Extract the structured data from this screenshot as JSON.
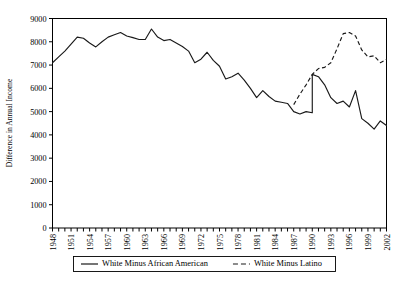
{
  "chart_data": {
    "type": "line",
    "title": "",
    "xlabel": "",
    "ylabel": "Difference in Annual Income",
    "ylim": [
      0,
      9000
    ],
    "xlim": [
      1948,
      2002
    ],
    "grid": false,
    "legend_position": "bottom",
    "y_ticks": [
      "0",
      "1000",
      "2000",
      "3000",
      "4000",
      "5000",
      "6000",
      "7000",
      "8000",
      "9000"
    ],
    "y_tick_values": [
      0,
      1000,
      2000,
      3000,
      4000,
      5000,
      6000,
      7000,
      8000,
      9000
    ],
    "x_tick_labels": [
      "1948",
      "1951",
      "1954",
      "1957",
      "1960",
      "1963",
      "1966",
      "1969",
      "1972",
      "1975",
      "1978",
      "1981",
      "1984",
      "1987",
      "1990",
      "1993",
      "1996",
      "1999",
      "2002"
    ],
    "x_tick_values": [
      1948,
      1951,
      1954,
      1957,
      1960,
      1963,
      1966,
      1969,
      1972,
      1975,
      1978,
      1981,
      1984,
      1987,
      1990,
      1993,
      1996,
      1999,
      2002
    ],
    "x_all_years": [
      1948,
      1949,
      1950,
      1951,
      1952,
      1953,
      1954,
      1955,
      1956,
      1957,
      1958,
      1959,
      1960,
      1961,
      1962,
      1963,
      1964,
      1965,
      1966,
      1967,
      1968,
      1969,
      1970,
      1971,
      1972,
      1973,
      1974,
      1975,
      1976,
      1977,
      1978,
      1979,
      1980,
      1981,
      1982,
      1983,
      1984,
      1985,
      1986,
      1987,
      1988,
      1989,
      1990,
      1991,
      1992,
      1993,
      1994,
      1995,
      1996,
      1997,
      1998,
      1999,
      2000,
      2001,
      2002
    ],
    "series": [
      {
        "name": "White Minus African American",
        "style": "solid",
        "color": "#1a1a1a",
        "x": [
          1948,
          1949,
          1950,
          1951,
          1952,
          1953,
          1954,
          1955,
          1956,
          1957,
          1958,
          1959,
          1960,
          1961,
          1962,
          1963,
          1964,
          1965,
          1966,
          1967,
          1968,
          1969,
          1970,
          1971,
          1972,
          1973,
          1974,
          1975,
          1976,
          1977,
          1978,
          1979,
          1980,
          1981,
          1982,
          1983,
          1984,
          1985,
          1986,
          1987,
          1988,
          1989,
          1990,
          1991,
          1992,
          1993,
          1994,
          1995,
          1996,
          1997,
          1998,
          1999,
          2000,
          2001,
          2002
        ],
        "values": [
          7100,
          7350,
          7600,
          7900,
          8200,
          8150,
          7950,
          7780,
          8000,
          8200,
          8300,
          8400,
          8250,
          8180,
          8100,
          8100,
          8550,
          8200,
          8050,
          8100,
          7950,
          7800,
          7600,
          7100,
          7250,
          7550,
          7200,
          6950,
          6400,
          6500,
          6650,
          6350,
          6000,
          5600,
          5900,
          5650,
          5450,
          5400,
          5350,
          5000,
          4900,
          5000,
          4950,
          5150,
          5400,
          5700,
          5550,
          5900,
          6200,
          6550,
          6400,
          6600,
          6500,
          6100,
          5850
        ]
      },
      {
        "name": "White Minus Latino",
        "style": "dashed",
        "color": "#1a1a1a",
        "x": [
          1987,
          1988,
          1989,
          1990,
          1991,
          1992,
          1993,
          1994,
          1995,
          1996,
          1997,
          1998,
          1999,
          2000,
          2001,
          2002
        ],
        "values": [
          5300,
          5750,
          6150,
          6600,
          6850,
          6900,
          7100,
          7700,
          8350,
          8400,
          8250,
          7650,
          7350,
          7400,
          7100,
          7250
        ]
      }
    ],
    "series_solid_tail": {
      "x": [
        1990,
        1991,
        1992,
        1993,
        1994,
        1995,
        1996,
        1997,
        1998,
        1999,
        2000,
        2001,
        2002
      ],
      "values": [
        6600,
        6500,
        6150,
        5600,
        5350,
        5450,
        5200,
        5900,
        4700,
        4500,
        4250,
        4600,
        4400
      ]
    }
  },
  "legend": {
    "entries": [
      {
        "label": "White Minus African American",
        "style": "solid"
      },
      {
        "label": "White Minus Latino",
        "style": "dashed"
      }
    ]
  }
}
